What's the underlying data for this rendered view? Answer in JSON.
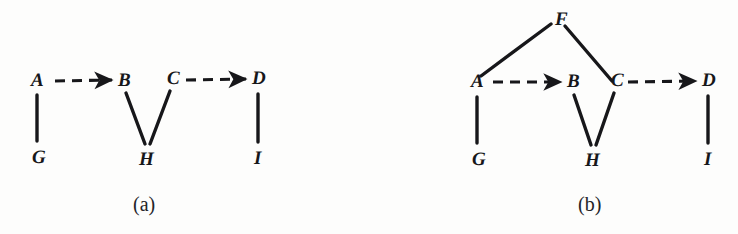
{
  "figure": {
    "background_color": "#fdfdfc",
    "ink_color": "#17171a",
    "width": 738,
    "height": 234,
    "panels": [
      {
        "id": "a",
        "caption": "(a)",
        "caption_pos": {
          "x": 133,
          "y": 194
        },
        "nodes": [
          {
            "id": "A",
            "label": "A",
            "x": 31,
            "y": 71
          },
          {
            "id": "B",
            "label": "B",
            "x": 118,
            "y": 71
          },
          {
            "id": "C",
            "label": "C",
            "x": 167,
            "y": 69
          },
          {
            "id": "D",
            "label": "D",
            "x": 252,
            "y": 69
          },
          {
            "id": "G",
            "label": "G",
            "x": 32,
            "y": 148
          },
          {
            "id": "H",
            "label": "H",
            "x": 139,
            "y": 150
          },
          {
            "id": "I",
            "label": "I",
            "x": 254,
            "y": 149
          }
        ],
        "edges": [
          {
            "from": "A",
            "to": "B",
            "style": "dashed",
            "arrow": true,
            "x1": 55,
            "y1": 81,
            "x2": 112,
            "y2": 80
          },
          {
            "from": "C",
            "to": "D",
            "style": "dashed",
            "arrow": true,
            "x1": 186,
            "y1": 80,
            "x2": 246,
            "y2": 79
          },
          {
            "from": "A",
            "to": "G",
            "style": "solid",
            "arrow": false,
            "x1": 37,
            "y1": 95,
            "x2": 37,
            "y2": 141
          },
          {
            "from": "B",
            "to": "H",
            "style": "solid",
            "arrow": false,
            "x1": 126,
            "y1": 93,
            "x2": 145,
            "y2": 144
          },
          {
            "from": "C",
            "to": "H",
            "style": "solid",
            "arrow": false,
            "x1": 170,
            "y1": 91,
            "x2": 150,
            "y2": 144
          },
          {
            "from": "D",
            "to": "I",
            "style": "solid",
            "arrow": false,
            "x1": 258,
            "y1": 94,
            "x2": 258,
            "y2": 142
          }
        ]
      },
      {
        "id": "b",
        "caption": "(b)",
        "caption_pos": {
          "x": 209,
          "y": 194
        },
        "nodes": [
          {
            "id": "F",
            "label": "F",
            "x": 186,
            "y": 10
          },
          {
            "id": "A",
            "label": "A",
            "x": 102,
            "y": 72
          },
          {
            "id": "B",
            "label": "B",
            "x": 198,
            "y": 72
          },
          {
            "id": "C",
            "label": "C",
            "x": 242,
            "y": 71
          },
          {
            "id": "D",
            "label": "D",
            "x": 333,
            "y": 71
          },
          {
            "id": "G",
            "label": "G",
            "x": 103,
            "y": 150
          },
          {
            "id": "H",
            "label": "H",
            "x": 216,
            "y": 151
          },
          {
            "id": "I",
            "label": "I",
            "x": 335,
            "y": 150
          }
        ],
        "edges": [
          {
            "from": "A",
            "to": "F",
            "style": "solid",
            "arrow": false,
            "x1": 112,
            "y1": 76,
            "x2": 182,
            "y2": 24
          },
          {
            "from": "F",
            "to": "C",
            "style": "solid",
            "arrow": false,
            "x1": 196,
            "y1": 26,
            "x2": 243,
            "y2": 81
          },
          {
            "from": "A",
            "to": "B",
            "style": "dashed",
            "arrow": true,
            "x1": 124,
            "y1": 82,
            "x2": 192,
            "y2": 82
          },
          {
            "from": "C",
            "to": "D",
            "style": "dashed",
            "arrow": true,
            "x1": 259,
            "y1": 82,
            "x2": 327,
            "y2": 81
          },
          {
            "from": "A",
            "to": "G",
            "style": "solid",
            "arrow": false,
            "x1": 108,
            "y1": 97,
            "x2": 108,
            "y2": 143
          },
          {
            "from": "B",
            "to": "H",
            "style": "solid",
            "arrow": false,
            "x1": 205,
            "y1": 95,
            "x2": 222,
            "y2": 145
          },
          {
            "from": "C",
            "to": "H",
            "style": "solid",
            "arrow": false,
            "x1": 245,
            "y1": 93,
            "x2": 227,
            "y2": 145
          },
          {
            "from": "D",
            "to": "I",
            "style": "solid",
            "arrow": false,
            "x1": 339,
            "y1": 96,
            "x2": 339,
            "y2": 143
          }
        ]
      }
    ]
  }
}
